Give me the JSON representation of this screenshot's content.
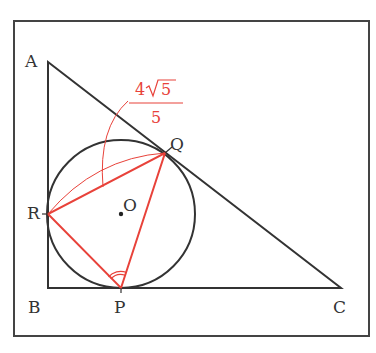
{
  "diagram": {
    "type": "geometry",
    "colors": {
      "black": "#333333",
      "red": "#e8423a"
    },
    "points": {
      "A": {
        "label": "A",
        "x": 48,
        "y": 62
      },
      "B": {
        "label": "B",
        "x": 48,
        "y": 288
      },
      "C": {
        "label": "C",
        "x": 341,
        "y": 288
      },
      "O": {
        "label": "O",
        "x": 121,
        "y": 214
      },
      "P": {
        "label": "P",
        "x": 121,
        "y": 288
      },
      "Q": {
        "label": "Q",
        "x": 165,
        "y": 153
      },
      "R": {
        "label": "R",
        "x": 48,
        "y": 214
      }
    },
    "circle": {
      "center": "O",
      "radius": 74
    },
    "annotation": {
      "segment": "RQ",
      "numerator": "4√5",
      "numerator_coef": "4",
      "numerator_rad": "5",
      "denominator": "5"
    },
    "angle_mark": {
      "vertex": "P",
      "angle": "RPQ",
      "style": "double-arc"
    }
  }
}
